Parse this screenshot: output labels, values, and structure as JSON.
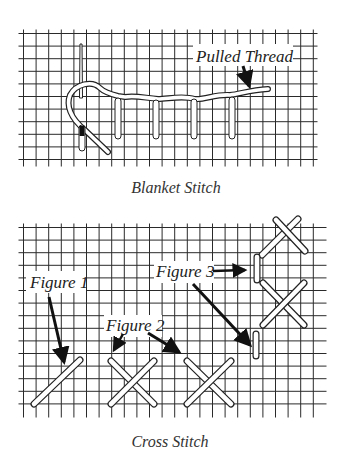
{
  "diagrams": [
    {
      "id": "blanket",
      "caption": "Blanket Stitch",
      "labels": [
        {
          "text": "Pulled Thread"
        }
      ]
    },
    {
      "id": "cross",
      "caption": "Cross Stitch",
      "labels": [
        {
          "text": "Figure 1"
        },
        {
          "text": "Figure 2"
        },
        {
          "text": "Figure 3"
        }
      ]
    }
  ],
  "colors": {
    "grid": "#2a2a2a",
    "thread_fill": "#ffffff",
    "thread_outline": "#222222",
    "arrow": "#111111",
    "text": "#222222"
  }
}
